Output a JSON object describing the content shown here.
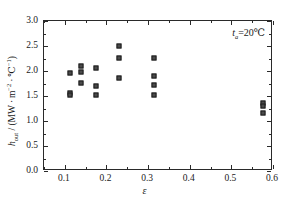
{
  "chart_data": {
    "type": "scatter",
    "title": "",
    "xlabel": "ε",
    "ylabel": "h_out / (MW · m⁻² · ℃⁻¹)",
    "xlim": [
      0.05,
      0.6
    ],
    "ylim": [
      0.0,
      3.0
    ],
    "xticks": [
      0.1,
      0.2,
      0.3,
      0.4,
      0.5,
      0.6
    ],
    "xtick_labels": [
      "0.1",
      "0.2",
      "0.3",
      "0.4",
      "0.5",
      "0.6"
    ],
    "yticks": [
      0.0,
      0.5,
      1.0,
      1.5,
      2.0,
      2.5,
      3.0
    ],
    "ytick_labels": [
      "0.0",
      "0.5",
      "1.0",
      "1.5",
      "2.0",
      "2.5",
      "3.0"
    ],
    "grid": false,
    "legend": null,
    "marker": "filled-square",
    "marker_color": "#4a4a4a",
    "marker_edge_color": "#1c1c1c",
    "annotation": "ta=20℃",
    "annotation_parts": {
      "symbol": "t",
      "subscript": "a",
      "equals_value": "=20℃"
    },
    "points": [
      {
        "x": 0.112,
        "y": 1.97
      },
      {
        "x": 0.112,
        "y": 1.56
      },
      {
        "x": 0.112,
        "y": 1.52
      },
      {
        "x": 0.139,
        "y": 2.1
      },
      {
        "x": 0.139,
        "y": 1.98
      },
      {
        "x": 0.139,
        "y": 1.76
      },
      {
        "x": 0.174,
        "y": 2.07
      },
      {
        "x": 0.174,
        "y": 1.7
      },
      {
        "x": 0.174,
        "y": 1.52
      },
      {
        "x": 0.229,
        "y": 2.5
      },
      {
        "x": 0.229,
        "y": 2.27
      },
      {
        "x": 0.229,
        "y": 1.87
      },
      {
        "x": 0.315,
        "y": 2.26
      },
      {
        "x": 0.315,
        "y": 1.91
      },
      {
        "x": 0.315,
        "y": 1.73
      },
      {
        "x": 0.315,
        "y": 1.53
      },
      {
        "x": 0.575,
        "y": 1.36
      },
      {
        "x": 0.575,
        "y": 1.31
      },
      {
        "x": 0.575,
        "y": 1.16
      }
    ]
  },
  "figure": {
    "background_color": "#ffffff",
    "axis_color": "#2a2a2a",
    "text_color": "#1a1a1a"
  }
}
